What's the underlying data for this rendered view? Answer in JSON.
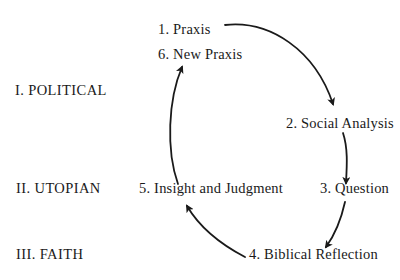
{
  "levels": [
    {
      "label": "I. POLITICAL"
    },
    {
      "label": "II. UTOPIAN"
    },
    {
      "label": "III. FAITH"
    }
  ],
  "steps": [
    {
      "label": "1. Praxis"
    },
    {
      "label": "2. Social Analysis"
    },
    {
      "label": "3. Question"
    },
    {
      "label": "4. Biblical Reflection"
    },
    {
      "label": "5. Insight and Judgment"
    },
    {
      "label": "6. New Praxis"
    }
  ],
  "colors": {
    "ink": "#1a1a1a",
    "background": "#ffffff"
  }
}
